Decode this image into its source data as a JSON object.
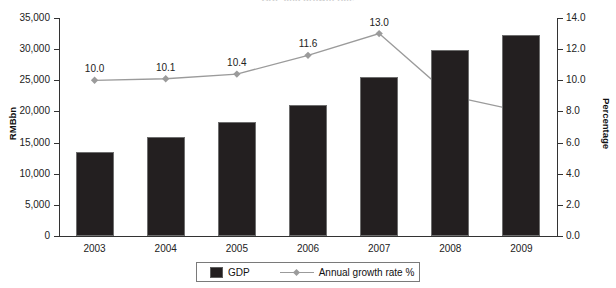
{
  "chart_data": {
    "type": "bar",
    "title": "GDP and growth rate",
    "categories": [
      "2003",
      "2004",
      "2005",
      "2006",
      "2007",
      "2008",
      "2009"
    ],
    "xlabel": "",
    "ylabel": "RMBbn",
    "y2label": "Percentage",
    "ylim": [
      0,
      35000
    ],
    "y2lim": [
      0,
      14
    ],
    "yticks": [
      "0",
      "5,000",
      "10,000",
      "15,000",
      "20,000",
      "25,000",
      "30,000",
      "35,000"
    ],
    "ytick_values": [
      0,
      5000,
      10000,
      15000,
      20000,
      25000,
      30000,
      35000
    ],
    "y2ticks": [
      "0.0",
      "2.0",
      "4.0",
      "6.0",
      "8.0",
      "10.0",
      "12.0",
      "14.0"
    ],
    "y2tick_values": [
      0,
      2,
      4,
      6,
      8,
      10,
      12,
      14
    ],
    "grid": false,
    "legend_position": "bottom",
    "series": [
      {
        "name": "GDP",
        "kind": "bar",
        "axis": "left",
        "color": "#231f20",
        "values": [
          13500,
          15900,
          18300,
          21000,
          25600,
          29900,
          32300
        ]
      },
      {
        "name": "Annual growth rate %",
        "kind": "line",
        "axis": "right",
        "color": "#9b9b9b",
        "values": [
          10.0,
          10.1,
          10.4,
          11.6,
          13.0,
          9.0,
          8.0
        ],
        "labels": [
          "10.0",
          "10.1",
          "10.4",
          "11.6",
          "13.0",
          "9.0",
          "8.0"
        ]
      }
    ]
  },
  "legend": {
    "gdp_label": "GDP",
    "growth_label": "Annual growth rate %"
  }
}
